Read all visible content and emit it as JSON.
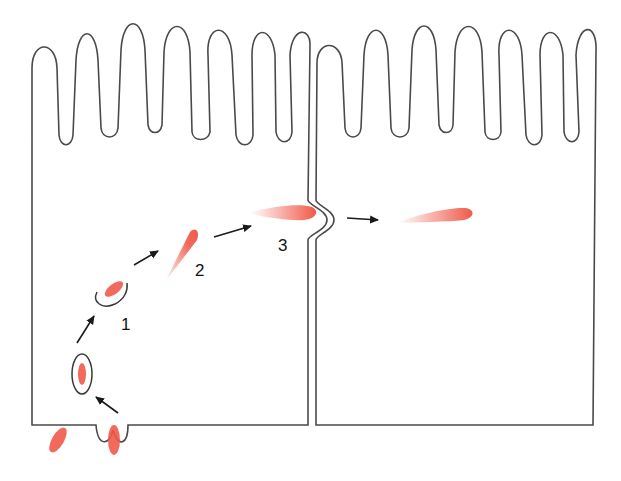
{
  "diagram": {
    "type": "transcytosis-epithelial-cells",
    "cells": [
      {
        "name": "left-epithelial-cell",
        "microvilli_count": 7
      },
      {
        "name": "right-epithelial-cell",
        "microvilli_count": 7
      }
    ],
    "steps": [
      {
        "label": "1",
        "description": "vesicle"
      },
      {
        "label": "2",
        "description": "released particle"
      },
      {
        "label": "3",
        "description": "crossing lateral membrane"
      }
    ],
    "colors": {
      "outline": "#4a4a4a",
      "particle": "#f05a4a",
      "arrow": "#1a1a1a",
      "background": "#ffffff"
    }
  }
}
